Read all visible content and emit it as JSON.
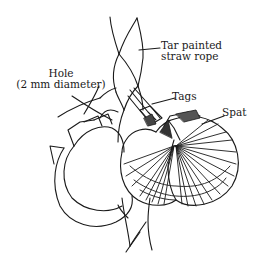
{
  "figure": {
    "kind": "line-drawing",
    "stroke_color": "#1a1a1a",
    "background_color": "#ffffff"
  },
  "labels": {
    "rope": {
      "line1": "Tar painted",
      "line2": "straw rope"
    },
    "hole": {
      "line1": "Hole",
      "line2": "(2 mm diameter)"
    },
    "tags": {
      "text": "Tags"
    },
    "spat": {
      "text": "Spat"
    }
  }
}
